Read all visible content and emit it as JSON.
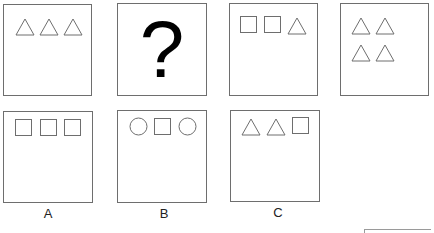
{
  "puzzle": {
    "sequence": [
      {
        "id": "panel-1",
        "shapes": [
          "triangle",
          "triangle",
          "triangle"
        ],
        "rows": 1
      },
      {
        "id": "panel-2",
        "content": "?"
      },
      {
        "id": "panel-3",
        "shapes": [
          "square",
          "square",
          "triangle"
        ],
        "rows": 1
      },
      {
        "id": "panel-4",
        "shapes": [
          "triangle",
          "triangle",
          "triangle",
          "triangle"
        ],
        "rows": 2
      }
    ],
    "options": [
      {
        "label": "A",
        "shapes": [
          "square",
          "square",
          "square"
        ]
      },
      {
        "label": "B",
        "shapes": [
          "circle",
          "square",
          "circle"
        ]
      },
      {
        "label": "C",
        "shapes": [
          "triangle",
          "triangle",
          "square"
        ]
      }
    ],
    "question_mark": "?"
  },
  "colors": {
    "stroke": "#6e6e6e",
    "border": "#6e6e6e",
    "text": "#222222"
  }
}
